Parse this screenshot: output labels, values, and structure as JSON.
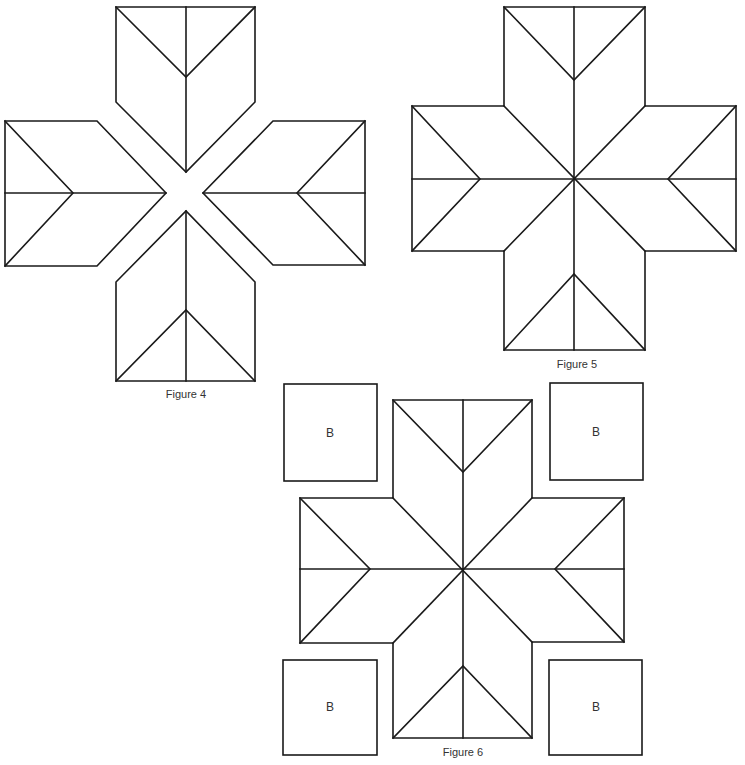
{
  "figures": [
    {
      "id": "figure-4",
      "caption": "Figure 4",
      "description": "Four star-point units separated (exploded view)"
    },
    {
      "id": "figure-5",
      "caption": "Figure 5",
      "description": "Four star-point units joined into an eight-point star"
    },
    {
      "id": "figure-6",
      "caption": "Figure 6",
      "description": "Star with four corner B squares"
    }
  ],
  "corner_squares": {
    "top_left": "B",
    "top_right": "B",
    "bottom_left": "B",
    "bottom_right": "B"
  },
  "colors": {
    "line": "#1a1a1a",
    "background": "#ffffff",
    "text": "#333333"
  }
}
